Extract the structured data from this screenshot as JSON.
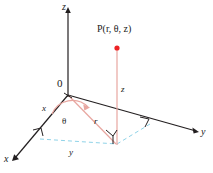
{
  "figure": {
    "type": "cylindrical-coordinates-diagram",
    "background_color": "#ffffff",
    "axis_color": "#231f20",
    "radial_color": "#e8a6a0",
    "point_color": "#ed2224",
    "projection_color": "#8fd3e8",
    "labels": {
      "z_axis": "z",
      "y_axis": "y",
      "x_axis": "x",
      "origin": "0",
      "x_segment": "x",
      "y_segment": "y",
      "z_segment": "z",
      "r_segment": "r",
      "theta_angle": "θ",
      "point_label": "P(r, θ, z)",
      "point_label_P": "P",
      "point_label_args": "(r, θ, z)"
    },
    "geometry": {
      "origin": [
        68,
        95
      ],
      "point_P": [
        117,
        48
      ],
      "foot_of_perpendicular": [
        117,
        144
      ],
      "z_axis_top": [
        68,
        8
      ],
      "y_axis_end": [
        198,
        130
      ],
      "x_axis_end": [
        13,
        160
      ],
      "x_axis_foot": [
        40,
        139
      ],
      "theta_arc_sweep_degrees": 52,
      "right_angle_markers": [
        {
          "name": "at-x-axis-foot",
          "position": [
            40,
            139
          ]
        },
        {
          "name": "at-y-axis-foot",
          "position": [
            150,
            124
          ]
        },
        {
          "name": "at-foot-of-perpendicular",
          "position": [
            117,
            144
          ]
        }
      ]
    }
  }
}
